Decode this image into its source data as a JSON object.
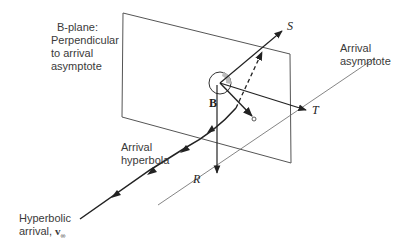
{
  "diagram": {
    "labels": {
      "bplane": [
        "B-plane:",
        "Perpendicular",
        "to arrival",
        "asymptote"
      ],
      "asymptote": [
        "Arrival",
        "asymptote"
      ],
      "hyperbola": [
        "Arrival",
        "hyperbola"
      ],
      "incoming": [
        "Hyperbolic",
        "arrival, "
      ],
      "v_inf": "v",
      "v_inf_sub": "∞",
      "v_inf_sup": "−"
    },
    "axes": {
      "S": "S",
      "T": "T",
      "R": "R",
      "B": "B"
    },
    "colors": {
      "line": "#333333",
      "plane": "#555555",
      "planet_fill": "#bbbbbb"
    }
  }
}
